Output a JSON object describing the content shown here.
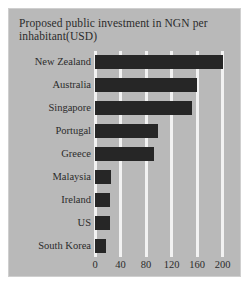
{
  "chart_data": {
    "type": "bar",
    "orientation": "horizontal",
    "title": "Proposed public investment in NGN per inhabitant(USD)",
    "title_lines": [
      "Proposed public investment in NGN per",
      "inhabitant(USD)"
    ],
    "xlabel": "",
    "ylabel": "",
    "categories": [
      "New Zealand",
      "Australia",
      "Singapore",
      "Portugal",
      "Greece",
      "Malaysia",
      "Ireland",
      "US",
      "South Korea"
    ],
    "values": [
      200,
      160,
      152,
      98,
      92,
      25,
      24,
      23,
      18
    ],
    "xlim": [
      0,
      210
    ],
    "xticks": [
      0,
      40,
      80,
      120,
      160,
      200
    ],
    "ytick_labels": [
      "New Zealand",
      "Australia",
      "Singapore",
      "Portugal",
      "Greece",
      "Malaysia",
      "Ireland",
      "US",
      "South Korea"
    ],
    "grid": true,
    "grid_axis": "x",
    "legend": false,
    "bar_color": "#262626",
    "grid_color": "#f2f2f2",
    "panel_color": "#b9b9b9",
    "text_color": "#2b2b2b"
  }
}
